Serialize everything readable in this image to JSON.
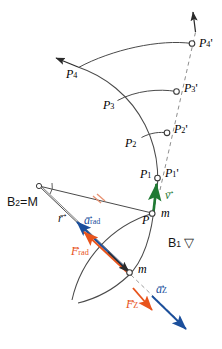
{
  "figure": {
    "background": "#ffffff",
    "colors": {
      "stroke": "#3a3a3a",
      "velocity_green": "#1f7a33",
      "acceleration_blue": "#1b4f9c",
      "force_orange": "#e8541c",
      "tickmark_orange": "#e89070",
      "dashed_gray": "#9a9a9a",
      "text_black": "#151515"
    }
  },
  "labels": {
    "p1": "P",
    "p1_sub": "1",
    "p1_prime": "P",
    "p1_prime_sub": "1",
    "p1_prime_mark": "'",
    "p2": "P",
    "p2_sub": "2",
    "p2_prime": "P",
    "p2_prime_sub": "2",
    "p2_prime_mark": "'",
    "p3": "P",
    "p3_sub": "3",
    "p3_prime": "P",
    "p3_prime_sub": "3",
    "p3_prime_mark": "'",
    "p4": "P",
    "p4_sub": "4",
    "p4_prime": "P",
    "p4_prime_sub": "4",
    "p4_prime_mark": "'",
    "p_point": "P",
    "mass_top": "m",
    "mass_bottom": "m",
    "body2": "B",
    "body2_sub": "2",
    "body2_eq": "=M",
    "body1": "B",
    "body1_sub": "1",
    "body1_glyph": "▽",
    "radius_vec": "r",
    "velocity_vec": "v",
    "a_rad_vec": "a",
    "a_rad_sub": "rad",
    "f_rad_vec": "F",
    "f_rad_sub": "rad",
    "a_z_vec": "a",
    "a_z_sub": "Z",
    "f_z_vec": "F",
    "f_z_sub": "Z",
    "vector_arrow": "→"
  },
  "icons": {
    "angle_marker": "angle-marker-icon",
    "equal_length_ticks": "double-tick-mark-icon",
    "open_circle_node": "open-circle-node-icon",
    "arrowhead": "arrowhead-icon",
    "triangle_down": "triangle-down-icon"
  },
  "geometry": {
    "center": {
      "x": 38,
      "y": 185
    },
    "points": [
      {
        "name": "P",
        "x": 152,
        "y": 213
      },
      {
        "name": "P1",
        "x": 156,
        "y": 178
      },
      {
        "name": "P1p",
        "x": 158,
        "y": 177
      },
      {
        "name": "P2",
        "x": 141,
        "y": 137
      },
      {
        "name": "P2p",
        "x": 167,
        "y": 133
      },
      {
        "name": "P3",
        "x": 117,
        "y": 100
      },
      {
        "name": "P3p",
        "x": 176,
        "y": 92
      },
      {
        "name": "P4",
        "x": 78,
        "y": 67
      },
      {
        "name": "P4p",
        "x": 192,
        "y": 44
      },
      {
        "name": "mLow",
        "x": 128,
        "y": 272
      }
    ]
  }
}
